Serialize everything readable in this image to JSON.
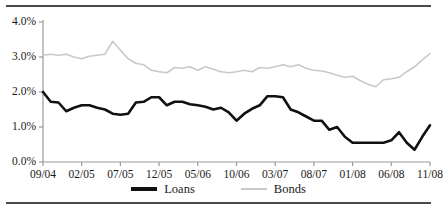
{
  "chart_data": {
    "type": "line",
    "title": "",
    "subtitle": "",
    "xlabel": "",
    "ylabel": "",
    "ylim": [
      0.0,
      4.0
    ],
    "ytick_labels": [
      "0.0%",
      "1.0%",
      "2.0%",
      "3.0%",
      "4.0%"
    ],
    "ytick_values": [
      0.0,
      1.0,
      2.0,
      3.0,
      4.0
    ],
    "xtick_labels": [
      "09/04",
      "02/05",
      "07/05",
      "12/05",
      "05/06",
      "10/06",
      "03/07",
      "08/07",
      "01/08",
      "06/08",
      "11/08"
    ],
    "xtick_indices": [
      0,
      5,
      10,
      15,
      20,
      25,
      30,
      35,
      40,
      45,
      50
    ],
    "grid": false,
    "legend_position": "bottom-center",
    "x": [
      "09/04",
      "10/04",
      "11/04",
      "12/04",
      "01/05",
      "02/05",
      "03/05",
      "04/05",
      "05/05",
      "06/05",
      "07/05",
      "08/05",
      "09/05",
      "10/05",
      "11/05",
      "12/05",
      "01/06",
      "02/06",
      "03/06",
      "04/06",
      "05/06",
      "06/06",
      "07/06",
      "08/06",
      "09/06",
      "10/06",
      "11/06",
      "12/06",
      "01/07",
      "02/07",
      "03/07",
      "04/07",
      "05/07",
      "06/07",
      "07/07",
      "08/07",
      "09/07",
      "10/07",
      "11/07",
      "12/07",
      "01/08",
      "02/08",
      "03/08",
      "04/08",
      "05/08",
      "06/08",
      "07/08",
      "08/08",
      "09/08",
      "10/08",
      "11/08"
    ],
    "series": [
      {
        "name": "Loans",
        "color": "#111111",
        "line_width": 2.6,
        "values": [
          2.0,
          1.72,
          1.7,
          1.45,
          1.55,
          1.62,
          1.62,
          1.55,
          1.5,
          1.38,
          1.35,
          1.38,
          1.7,
          1.72,
          1.85,
          1.85,
          1.62,
          1.72,
          1.72,
          1.65,
          1.62,
          1.58,
          1.5,
          1.55,
          1.42,
          1.18,
          1.38,
          1.52,
          1.62,
          1.88,
          1.88,
          1.85,
          1.5,
          1.42,
          1.3,
          1.18,
          1.18,
          0.92,
          1.0,
          0.72,
          0.55,
          0.55,
          0.55,
          0.55,
          0.55,
          0.62,
          0.85,
          0.55,
          0.35,
          0.72,
          1.05
        ]
      },
      {
        "name": "Bonds",
        "color": "#c9c9c9",
        "line_width": 1.6,
        "values": [
          3.05,
          3.08,
          3.05,
          3.08,
          3.0,
          2.95,
          3.02,
          3.05,
          3.08,
          3.45,
          3.2,
          2.95,
          2.82,
          2.78,
          2.62,
          2.58,
          2.55,
          2.7,
          2.68,
          2.72,
          2.62,
          2.72,
          2.65,
          2.58,
          2.55,
          2.58,
          2.62,
          2.58,
          2.7,
          2.68,
          2.72,
          2.78,
          2.72,
          2.78,
          2.68,
          2.62,
          2.6,
          2.55,
          2.48,
          2.42,
          2.45,
          2.32,
          2.22,
          2.15,
          2.35,
          2.38,
          2.42,
          2.58,
          2.72,
          2.92,
          3.1
        ]
      }
    ],
    "series_tail_note": "Loans rises sharply through 2008 and flattens at 3.0%; Bonds rises to 3.6%",
    "loans_values_full": [
      2.0,
      1.72,
      1.7,
      1.45,
      1.55,
      1.62,
      1.62,
      1.55,
      1.5,
      1.38,
      1.35,
      1.38,
      1.7,
      1.72,
      1.85,
      1.85,
      1.62,
      1.72,
      1.72,
      1.65,
      1.62,
      1.58,
      1.5,
      1.55,
      1.42,
      1.18,
      1.38,
      1.52,
      1.62,
      1.88,
      1.88,
      1.85,
      1.5,
      1.42,
      1.3,
      1.18,
      1.18,
      0.92,
      1.0,
      0.72,
      0.55,
      0.55,
      0.55,
      0.55,
      0.55,
      0.62,
      0.85,
      0.55,
      0.35,
      0.72,
      1.05
    ],
    "bonds_values_full": [
      3.05,
      3.08,
      3.05,
      3.08,
      3.0,
      2.95,
      3.02,
      3.05,
      3.08,
      3.45,
      3.2,
      2.95,
      2.82,
      2.78,
      2.62,
      2.58,
      2.55,
      2.7,
      2.68,
      2.72,
      2.62,
      2.72,
      2.65,
      2.58,
      2.55,
      2.58,
      2.62,
      2.58,
      2.7,
      2.68,
      2.72,
      2.78,
      2.72,
      2.78,
      2.68,
      2.62,
      2.6,
      2.55,
      2.48,
      2.42,
      2.45,
      2.32,
      2.22,
      2.15,
      2.35,
      2.38,
      2.42,
      2.58,
      2.72,
      2.92,
      3.1
    ]
  },
  "legend": {
    "entries": [
      {
        "label": "Loans",
        "key": "loans"
      },
      {
        "label": "Bonds",
        "key": "bonds"
      }
    ]
  },
  "axes": {
    "y_labels": [
      "4.0%",
      "3.0%",
      "2.0%",
      "1.0%",
      "0.0%"
    ],
    "x_labels": [
      "09/04",
      "02/05",
      "07/05",
      "12/05",
      "05/06",
      "10/06",
      "03/07",
      "08/07",
      "01/08",
      "06/08",
      "11/08"
    ]
  },
  "colors": {
    "loans_line": "#111111",
    "bonds_line": "#c9c9c9",
    "axis": "#9a9a9a",
    "rule": "#4a4a4a",
    "text": "#1a1a1a",
    "background": "#ffffff"
  }
}
